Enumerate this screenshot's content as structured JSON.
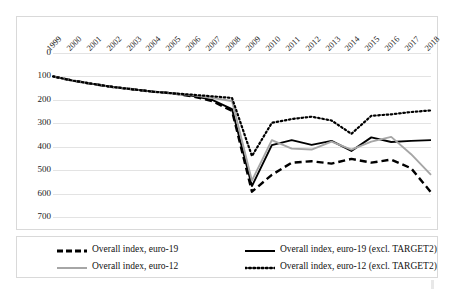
{
  "chart_data": {
    "type": "line",
    "title": "",
    "xlabel": "",
    "ylabel": "",
    "y_inverted": true,
    "ylim": [
      0,
      700
    ],
    "yticks": [
      0,
      100,
      200,
      300,
      400,
      500,
      600,
      700
    ],
    "grid": true,
    "legend_position": "bottom",
    "categories": [
      "1999",
      "2000",
      "2001",
      "2002",
      "2003",
      "2004",
      "2005",
      "2006",
      "2007",
      "2008",
      "2009",
      "2010",
      "2011",
      "2012",
      "2013",
      "2014",
      "2015",
      "2016",
      "2017",
      "2018"
    ],
    "series": [
      {
        "name": "Overall index, euro-19",
        "style": "dashed",
        "color": "#000000",
        "values": [
          100,
          118,
          132,
          145,
          155,
          165,
          172,
          185,
          205,
          247,
          592,
          520,
          468,
          462,
          472,
          452,
          468,
          455,
          492,
          595
        ]
      },
      {
        "name": "Overall index, euro-19 (excl. TARGET2)",
        "style": "solid",
        "color": "#000000",
        "values": [
          100,
          118,
          132,
          145,
          155,
          165,
          172,
          183,
          200,
          240,
          568,
          393,
          372,
          392,
          375,
          418,
          360,
          380,
          375,
          372
        ]
      },
      {
        "name": "Overall index, euro-12",
        "style": "solid",
        "color": "#a6a6a6",
        "values": [
          100,
          118,
          132,
          145,
          155,
          165,
          172,
          180,
          192,
          205,
          545,
          372,
          408,
          412,
          378,
          412,
          378,
          358,
          432,
          520
        ]
      },
      {
        "name": "Overall index, euro-12 (excl. TARGET2)",
        "style": "dotted",
        "color": "#000000",
        "values": [
          100,
          118,
          132,
          145,
          155,
          165,
          172,
          178,
          185,
          192,
          440,
          298,
          282,
          272,
          288,
          345,
          268,
          262,
          252,
          245
        ]
      }
    ]
  },
  "legend": {
    "items": [
      {
        "label": "Overall index, euro-19",
        "style": "dashed",
        "color": "#000000"
      },
      {
        "label": "Overall index, euro-19 (excl. TARGET2)",
        "style": "solid",
        "color": "#000000"
      },
      {
        "label": "Overall index, euro-12",
        "style": "solid",
        "color": "#a6a6a6"
      },
      {
        "label": "Overall index, euro-12 (excl. TARGET2)",
        "style": "dotted",
        "color": "#000000"
      }
    ]
  }
}
